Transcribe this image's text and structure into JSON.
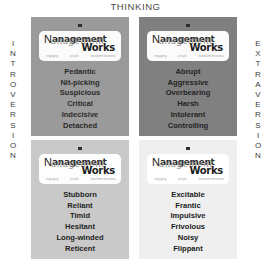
{
  "diagram": {
    "type": "2x2-quadrant-matrix",
    "top_axis_label": "THINKING",
    "left_axis_label": "INTROVERSION",
    "right_axis_label": "EXTRAVERSION",
    "left_axis_letters": [
      "I",
      "N",
      "T",
      "R",
      "O",
      "V",
      "E",
      "R",
      "S",
      "I",
      "O",
      "N"
    ],
    "right_axis_letters": [
      "E",
      "X",
      "T",
      "R",
      "A",
      "V",
      "E",
      "R",
      "S",
      "I",
      "O",
      "N"
    ],
    "logo": {
      "initial": "N",
      "word_top": "anagement",
      "script_overlay": "anagement",
      "word_bottom": "Works",
      "tagline_left": "engaging",
      "tagline_mid": "people",
      "tagline_right": "transform business",
      "marker": "square-dash-marker"
    },
    "quadrants": [
      {
        "id": "thinking-introversion",
        "position": "top-left",
        "background": "#9a9a9a",
        "traits": [
          "Pedantic",
          "Nit-picking",
          "Suspicious",
          "Critical",
          "Indecisive",
          "Detached"
        ]
      },
      {
        "id": "thinking-extraversion",
        "position": "top-right",
        "background": "#808080",
        "traits": [
          "Abrupt",
          "Aggressive",
          "Overbearing",
          "Harsh",
          "Intolerant",
          "Controlling"
        ]
      },
      {
        "id": "feeling-introversion",
        "position": "bottom-left",
        "background": "#c9c9c9",
        "traits": [
          "Stubborn",
          "Reliant",
          "Timid",
          "Hesitant",
          "Long-winded",
          "Reticent"
        ]
      },
      {
        "id": "feeling-extraversion",
        "position": "bottom-right",
        "background": "#efefef",
        "traits": [
          "Excitable",
          "Frantic",
          "Impulsive",
          "Frivolous",
          "Noisy",
          "Flippant"
        ]
      }
    ]
  }
}
